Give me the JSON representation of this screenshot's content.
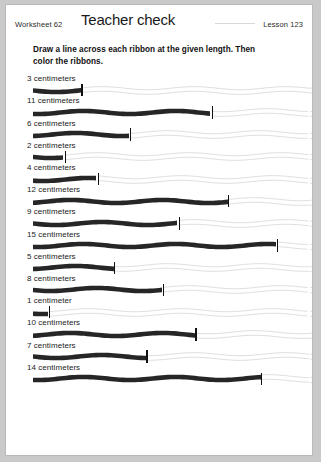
{
  "page": {
    "background_color": "#c9c9c9",
    "paper_color": "#ffffff",
    "border_color": "#b9b9b9"
  },
  "header": {
    "worksheet_label": "Worksheet 62",
    "title": "Teacher check",
    "lesson_label": "Lesson 123"
  },
  "instructions": {
    "line1": "Draw a line across each ribbon at the given length.  Then",
    "line2": "color the ribbons."
  },
  "ribbon_style": {
    "colored_color": "#262626",
    "outline_color": "#d6d6d6",
    "tick_color": "#111111",
    "origin_x_px": 27,
    "pixels_per_cm": 16.3,
    "max_length_cm": 17
  },
  "rows": [
    {
      "label": "3 centimeters",
      "length_cm": 3
    },
    {
      "label": "11 centimeters",
      "length_cm": 11
    },
    {
      "label": "6 centimeters",
      "length_cm": 6
    },
    {
      "label": "2 centimeters",
      "length_cm": 2
    },
    {
      "label": "4 centimeters",
      "length_cm": 4
    },
    {
      "label": "12 centimeters",
      "length_cm": 12
    },
    {
      "label": "9 centimeters",
      "length_cm": 9
    },
    {
      "label": "15 centimeters",
      "length_cm": 15
    },
    {
      "label": "5 centimeters",
      "length_cm": 5
    },
    {
      "label": "8 centimeters",
      "length_cm": 8
    },
    {
      "label": "1 centimeter",
      "length_cm": 1
    },
    {
      "label": "10 centimeters",
      "length_cm": 10
    },
    {
      "label": "7 centimeters",
      "length_cm": 7
    },
    {
      "label": "14 centimeters",
      "length_cm": 14
    }
  ]
}
